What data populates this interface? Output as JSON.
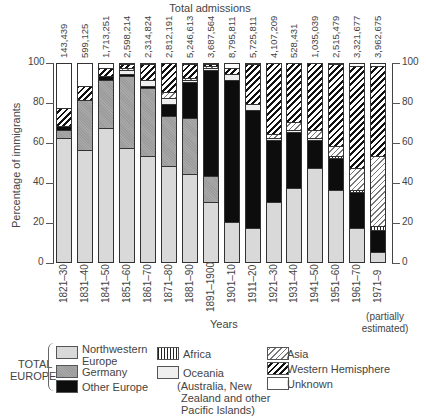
{
  "chart_data": {
    "type": "bar",
    "stacked": true,
    "title": "Total admissions",
    "xlabel": "Years",
    "ylabel": "Percentage of immigrants",
    "ylim": [
      0,
      100
    ],
    "yticks": [
      0,
      20,
      40,
      60,
      80,
      100
    ],
    "categories": [
      "1821–30",
      "1831–40",
      "1841–50",
      "1851–60",
      "1861–70",
      "1871–80",
      "1881–90",
      "1891–1900",
      "1901–10",
      "1911–20",
      "1921–30",
      "1931–40",
      "1941–50",
      "1951–60",
      "1961–70",
      "1971–9"
    ],
    "category_note": "(partially estimated)",
    "total_admissions": [
      "143,439",
      "599,125",
      "1,713,251",
      "2,598,214",
      "2,314,824",
      "2,812,191",
      "5,246,613",
      "3,687,564",
      "8,795,811",
      "5,725,811",
      "4,107,209",
      "528,431",
      "1,035,039",
      "2,515,479",
      "3,321,677",
      "3,962,675"
    ],
    "series": [
      {
        "name": "Northwestern Europe",
        "group": "TOTAL EUROPE",
        "values": [
          62,
          56,
          67,
          57,
          53,
          48,
          44,
          30,
          20,
          17,
          30,
          37,
          47,
          36,
          17,
          5
        ]
      },
      {
        "name": "Germany",
        "group": "TOTAL EUROPE",
        "values": [
          4,
          25,
          24,
          36,
          34,
          25,
          28,
          13,
          0,
          0,
          0,
          0,
          0,
          0,
          0,
          0
        ]
      },
      {
        "name": "Other Europe",
        "group": "TOTAL EUROPE",
        "values": [
          2,
          0,
          2,
          1,
          1,
          6,
          18,
          53,
          71,
          59,
          31,
          28,
          14,
          16,
          18,
          11
        ]
      },
      {
        "name": "Africa",
        "values": [
          0,
          0,
          0,
          0,
          0,
          0,
          0,
          0,
          0,
          0,
          0,
          0,
          0,
          1,
          1,
          2
        ]
      },
      {
        "name": "Oceania",
        "note": "(Australia, New Zealand and other Pacific Islands)",
        "values": [
          0,
          0,
          0,
          2,
          3,
          3,
          1,
          1,
          3,
          3,
          1,
          1,
          1,
          0,
          0,
          0
        ]
      },
      {
        "name": "Asia",
        "values": [
          0,
          0,
          0,
          1,
          0,
          3,
          1,
          1,
          0,
          0,
          2,
          4,
          4,
          5,
          11,
          35
        ]
      },
      {
        "name": "Western Hemisphere",
        "values": [
          9,
          7,
          4,
          2,
          8,
          15,
          7,
          1,
          3,
          20,
          36,
          30,
          34,
          41,
          51,
          45
        ]
      },
      {
        "name": "Unknown",
        "values": [
          23,
          12,
          3,
          1,
          1,
          0,
          1,
          1,
          0,
          1,
          0,
          0,
          0,
          1,
          2,
          2
        ]
      }
    ],
    "legend_position": "bottom",
    "grid": false
  },
  "legend": {
    "group_label_line1": "TOTAL",
    "group_label_line2": "EUROPE",
    "nw_line1": "Northwestern",
    "nw_line2": "Europe",
    "germany": "Germany",
    "other_europe": "Other Europe",
    "africa": "Africa",
    "oceania": "Oceania",
    "oceania_note1": "(Australia, New",
    "oceania_note2": "Zealand and other",
    "oceania_note3": "Pacific Islands)",
    "asia": "Asia",
    "western_hemisphere": "Western Hemisphere",
    "unknown": "Unknown"
  },
  "axis": {
    "left_ticks": [
      "0",
      "20",
      "40",
      "60",
      "80",
      "100"
    ],
    "right_ticks": [
      "0",
      "20",
      "40",
      "60",
      "80",
      "100"
    ]
  }
}
